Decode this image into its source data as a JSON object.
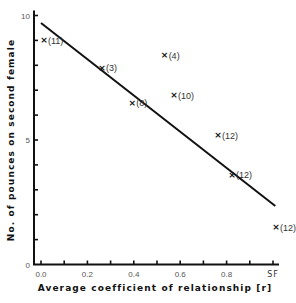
{
  "chart_data": {
    "type": "scatter",
    "title": "",
    "xlabel": "Average coefficient of relationship [r]",
    "ylabel": "No. of pounces on second female",
    "xlim": [
      0.0,
      1.0
    ],
    "ylim": [
      0,
      10
    ],
    "grid": false,
    "legend": null,
    "x_ticks": [
      0.0,
      0.1,
      0.2,
      0.3,
      0.4,
      0.5,
      0.6,
      0.7,
      0.8,
      0.9,
      1.0
    ],
    "x_tick_labels": [
      {
        "x": 0.0,
        "label": "0.0"
      },
      {
        "x": 0.2,
        "label": "0.2"
      },
      {
        "x": 0.4,
        "label": "0.4"
      },
      {
        "x": 0.6,
        "label": "0.6"
      },
      {
        "x": 0.8,
        "label": "0.8"
      },
      {
        "x": 1.0,
        "label": "SF"
      }
    ],
    "y_ticks": [
      0,
      1,
      2,
      3,
      4,
      5,
      6,
      7,
      8,
      9,
      10
    ],
    "y_tick_labels": [
      {
        "y": 0,
        "label": "0"
      },
      {
        "y": 5,
        "label": "5"
      },
      {
        "y": 10,
        "label": "10"
      }
    ],
    "marker": "x",
    "points": [
      {
        "x": 0.0,
        "y": 9.0,
        "n": "(11)"
      },
      {
        "x": 0.25,
        "y": 7.9,
        "n": "(3)"
      },
      {
        "x": 0.38,
        "y": 6.5,
        "n": "(8)"
      },
      {
        "x": 0.52,
        "y": 8.4,
        "n": "(4)"
      },
      {
        "x": 0.56,
        "y": 6.8,
        "n": "(10)"
      },
      {
        "x": 0.75,
        "y": 5.2,
        "n": "(12)"
      },
      {
        "x": 0.81,
        "y": 3.6,
        "n": "(12)"
      },
      {
        "x": 1.0,
        "y": 1.5,
        "n": "(12)"
      }
    ],
    "regression_line": {
      "x1": 0.0,
      "y1": 9.7,
      "x2": 1.01,
      "y2": 2.35
    },
    "annotations": [
      "numbers in parentheses = sample size n"
    ]
  },
  "colors": {
    "axis": "#111111",
    "line": "#111111",
    "background": "#ffffff"
  }
}
